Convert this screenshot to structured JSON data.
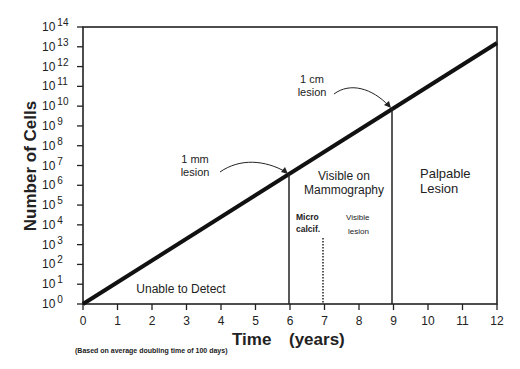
{
  "chart_data": {
    "type": "line",
    "title": "",
    "xlabel": "Time (years)",
    "ylabel": "Number of Cells",
    "note": "(Based on average doubling time of 100 days)",
    "x_ticks": [
      "0",
      "1",
      "2",
      "3",
      "4",
      "5",
      "6",
      "7",
      "8",
      "9",
      "10",
      "11",
      "12"
    ],
    "y_ticks": [
      "10^0",
      "10^1",
      "10^2",
      "10^3",
      "10^4",
      "10^5",
      "10^6",
      "10^7",
      "10^8",
      "10^9",
      "10^10",
      "10^11",
      "10^12",
      "10^13",
      "10^14"
    ],
    "xlim": [
      0,
      12
    ],
    "ylim_log10": [
      0,
      14
    ],
    "y_scale": "log",
    "grid": false,
    "series": [
      {
        "name": "Tumor cell growth",
        "x": [
          0,
          6,
          9,
          12
        ],
        "y_log10": [
          0,
          6.5,
          9.8,
          13.2
        ]
      }
    ],
    "annotations": [
      {
        "text": "1 mm lesion",
        "x": 6,
        "y_log10": 6.5
      },
      {
        "text": "1 cm lesion",
        "x": 9,
        "y_log10": 9.8
      },
      {
        "text": "Unable to Detect",
        "region": [
          0,
          6
        ]
      },
      {
        "text": "Visible on Mammography",
        "region": [
          6,
          9
        ]
      },
      {
        "text": "Micro calcif.",
        "x": 7,
        "style": "dotted line"
      },
      {
        "text": "Visible lesion",
        "region": [
          7,
          9
        ]
      },
      {
        "text": "Palpable Lesion",
        "region": [
          9,
          12
        ]
      }
    ]
  },
  "labels": {
    "ylabel": "Number of Cells",
    "xlabel_time": "Time",
    "xlabel_units": "(years)",
    "note": "(Based on average doubling time of 100 days)",
    "one_mm_1": "1 mm",
    "one_mm_2": "lesion",
    "one_cm_1": "1 cm",
    "one_cm_2": "lesion",
    "unable": "Unable to Detect",
    "visible_1": "Visible on",
    "visible_2": "Mammography",
    "micro_1": "Micro",
    "micro_2": "calcif.",
    "vlesion_1": "Visible",
    "vlesion_2": "lesion",
    "palp_1": "Palpable",
    "palp_2": "Lesion"
  }
}
